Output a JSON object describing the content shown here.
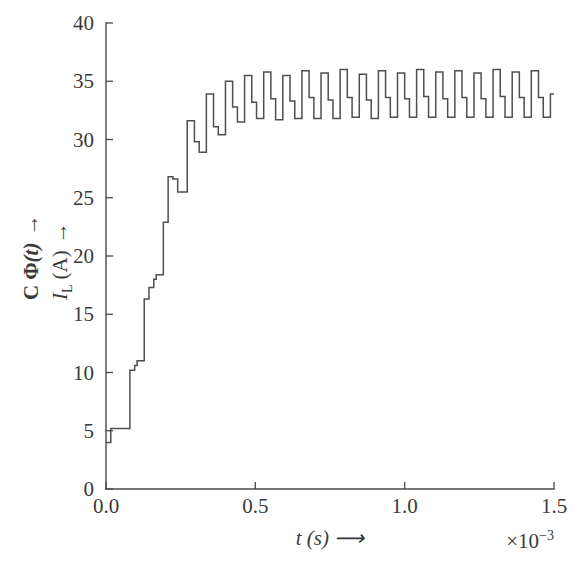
{
  "chart_data": {
    "type": "line",
    "title": "",
    "subtitle": "",
    "xlabel": "t (s) ⟶",
    "ylabel_primary": "C Φ(t) ⟶",
    "ylabel_secondary": "I_L (A) ⟶",
    "ylabel_secondary_parts": {
      "italic_I": "I",
      "subscript_L": "L",
      "unit": "(A)",
      "arrow": "→"
    },
    "ylabel_primary_parts": {
      "bold_C": "C",
      "bold_phi": "Φ",
      "italic_t": "(t)",
      "arrow": "→"
    },
    "x_multiplier_label": "×10",
    "x_multiplier_exponent": "−3",
    "x_multiplier_full": "×10⁻³",
    "xticks": [
      0.0,
      0.5,
      1.0,
      1.5
    ],
    "xtick_labels": [
      "0.0",
      "0.5",
      "1.0",
      "1.5"
    ],
    "yticks": [
      0,
      5,
      10,
      15,
      20,
      25,
      30,
      35,
      40
    ],
    "ytick_labels": [
      "0",
      "5",
      "10",
      "15",
      "20",
      "25",
      "30",
      "35",
      "40"
    ],
    "xlim": [
      0.0,
      1.5
    ],
    "ylim": [
      0,
      40
    ],
    "grid": false,
    "legend": null,
    "line_color": "#4f4f4f",
    "axis_color": "#4a4a4a",
    "series": [
      {
        "name": "I_L (A)",
        "step_type": "post",
        "x": [
          0.0,
          0.008,
          0.016,
          0.024,
          0.032,
          0.04,
          0.048,
          0.056,
          0.064,
          0.072,
          0.08,
          0.088,
          0.096,
          0.104,
          0.112,
          0.12,
          0.128,
          0.136,
          0.144,
          0.152,
          0.16,
          0.168,
          0.176,
          0.184,
          0.192,
          0.2,
          0.208,
          0.216,
          0.224,
          0.232,
          0.24,
          0.248,
          0.256,
          0.264,
          0.272,
          0.28,
          0.288,
          0.296,
          0.304,
          0.312,
          0.32,
          0.328,
          0.336,
          0.344,
          0.352,
          0.36,
          0.368,
          0.376,
          0.384,
          0.392,
          0.4,
          0.408,
          0.416,
          0.424,
          0.432,
          0.44,
          0.448,
          0.456,
          0.464,
          0.472,
          0.48,
          0.488,
          0.496,
          0.504,
          0.512,
          0.52,
          0.528,
          0.536,
          0.544,
          0.552,
          0.56,
          0.568,
          0.576,
          0.584,
          0.592,
          0.6,
          0.608,
          0.616,
          0.624,
          0.632,
          0.64,
          0.648,
          0.656,
          0.664,
          0.672,
          0.68,
          0.688,
          0.696,
          0.704,
          0.712,
          0.72,
          0.728,
          0.736,
          0.744,
          0.752,
          0.76,
          0.768,
          0.776,
          0.784,
          0.792,
          0.8,
          0.808,
          0.816,
          0.824,
          0.832,
          0.84,
          0.848,
          0.856,
          0.864,
          0.872,
          0.88,
          0.888,
          0.896,
          0.904,
          0.912,
          0.92,
          0.928,
          0.936,
          0.944,
          0.952,
          0.96,
          0.968,
          0.976,
          0.984,
          0.992,
          1.0,
          1.008,
          1.016,
          1.024,
          1.032,
          1.04,
          1.048,
          1.056,
          1.064,
          1.072,
          1.08,
          1.088,
          1.096,
          1.104,
          1.112,
          1.12,
          1.128,
          1.136,
          1.144,
          1.152,
          1.16,
          1.168,
          1.176,
          1.184,
          1.192,
          1.2,
          1.208,
          1.216,
          1.224,
          1.232,
          1.24,
          1.248,
          1.256,
          1.264,
          1.272,
          1.28,
          1.288,
          1.296,
          1.304,
          1.312,
          1.32,
          1.328,
          1.336,
          1.344,
          1.352,
          1.36,
          1.368,
          1.376,
          1.384,
          1.392,
          1.4,
          1.408,
          1.416,
          1.424,
          1.432,
          1.44,
          1.448,
          1.456,
          1.464,
          1.472,
          1.48,
          1.488,
          1.5
        ],
        "y": [
          4.0,
          4.0,
          5.2,
          5.2,
          5.2,
          5.2,
          5.2,
          5.2,
          5.2,
          5.2,
          10.2,
          10.2,
          10.6,
          11.0,
          11.0,
          11.0,
          16.3,
          16.3,
          17.3,
          17.3,
          18.0,
          18.4,
          18.4,
          18.4,
          22.9,
          22.9,
          26.8,
          26.8,
          26.6,
          26.6,
          25.5,
          25.5,
          25.5,
          25.5,
          31.6,
          31.6,
          31.6,
          29.8,
          29.8,
          28.9,
          28.9,
          28.9,
          33.9,
          33.9,
          33.9,
          31.1,
          31.1,
          30.4,
          30.4,
          30.4,
          35.0,
          35.0,
          35.0,
          32.8,
          32.8,
          31.5,
          31.5,
          31.5,
          35.5,
          35.5,
          35.5,
          33.2,
          33.2,
          31.8,
          31.8,
          31.8,
          35.8,
          35.8,
          35.8,
          33.5,
          33.5,
          31.7,
          31.7,
          31.7,
          35.5,
          35.5,
          35.5,
          33.3,
          33.3,
          31.8,
          31.8,
          31.8,
          35.9,
          35.9,
          35.9,
          33.6,
          33.6,
          31.8,
          31.8,
          31.8,
          35.7,
          35.7,
          35.7,
          33.4,
          33.4,
          31.8,
          31.8,
          31.8,
          36.0,
          36.0,
          36.0,
          33.6,
          33.6,
          31.9,
          31.9,
          31.9,
          35.6,
          35.6,
          35.6,
          33.4,
          33.4,
          31.8,
          31.8,
          31.8,
          35.9,
          35.9,
          35.9,
          33.6,
          33.6,
          31.9,
          31.9,
          31.9,
          35.7,
          35.7,
          35.7,
          33.5,
          33.5,
          31.9,
          31.9,
          31.9,
          36.0,
          36.0,
          36.0,
          33.7,
          33.7,
          31.9,
          31.9,
          31.9,
          35.8,
          35.8,
          35.8,
          33.5,
          33.5,
          31.9,
          31.9,
          31.9,
          35.9,
          35.9,
          35.9,
          33.6,
          33.6,
          31.9,
          31.9,
          31.9,
          35.7,
          35.7,
          35.7,
          33.5,
          33.5,
          31.9,
          31.9,
          31.9,
          36.0,
          36.0,
          36.0,
          33.7,
          33.7,
          31.9,
          31.9,
          31.9,
          35.8,
          35.8,
          35.8,
          33.6,
          33.6,
          31.9,
          31.9,
          31.9,
          35.9,
          35.9,
          35.9,
          33.6,
          33.6,
          31.9,
          31.9,
          31.9,
          33.9,
          33.9
        ]
      }
    ],
    "description_notes": {
      "waveform": "staircase / PWM-like current ripple rising from ~4 A to a steady oscillation between ~32 A and ~36 A",
      "steady_state_mean": 33.8,
      "ripple_peak": 36.0,
      "ripple_trough": 31.8,
      "final_value": 33.9
    }
  }
}
